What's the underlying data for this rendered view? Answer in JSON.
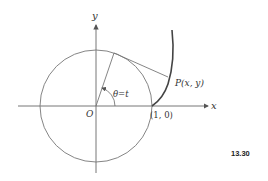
{
  "diagram": {
    "axes": {
      "x_label": "x",
      "y_label": "y",
      "origin_label": "O"
    },
    "circle": {
      "description": "unit circle"
    },
    "angle_label": "θ=t",
    "point_label": "P(x, y)",
    "start_point_label": "(1, 0)",
    "figure_number": "13.30",
    "colors": {
      "stroke": "#555555",
      "curve": "#444444",
      "text": "#333333"
    }
  }
}
